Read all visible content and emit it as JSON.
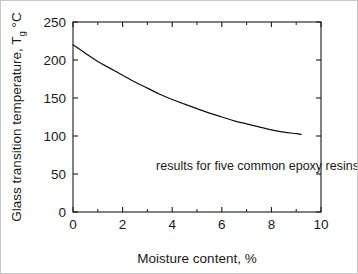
{
  "chart_data": {
    "type": "line",
    "title": "",
    "xlabel": "Moisture content, %",
    "ylabel_main": "Glass transition temperature, T",
    "ylabel_sub": "g",
    "ylabel_unit": "°C",
    "ylabel_full": "Glass transition temperature, Tg °C",
    "xlim": [
      0,
      10
    ],
    "ylim": [
      0,
      250
    ],
    "grid": false,
    "legend": "none",
    "x_ticks_major": [
      0,
      2,
      4,
      6,
      8,
      10
    ],
    "x_tick_labels": [
      "0",
      "2",
      "4",
      "6",
      "8",
      "10"
    ],
    "x_ticks_minor": [
      1,
      3,
      5,
      7,
      9
    ],
    "y_ticks_major": [
      0,
      50,
      100,
      150,
      200,
      250
    ],
    "y_tick_labels": [
      "0",
      "50",
      "100",
      "150",
      "200",
      "250"
    ],
    "series": [
      {
        "name": "Glass transition temperature vs moisture content",
        "color": "#111111",
        "x": [
          0,
          0.5,
          1,
          1.5,
          2,
          2.5,
          3,
          3.5,
          4,
          4.5,
          5,
          5.5,
          6,
          6.5,
          7,
          7.5,
          8,
          8.5,
          9,
          9.2
        ],
        "y": [
          220,
          209,
          198,
          189,
          180,
          171,
          163,
          155,
          148,
          142,
          136,
          130,
          125,
          120,
          116,
          112,
          108,
          105,
          103,
          102
        ]
      }
    ],
    "annotations": [
      {
        "text": "results for five common epoxy resins",
        "x": 3.35,
        "y": 55
      }
    ]
  },
  "figure": {
    "background_color": "#ffffff",
    "axis_color": "#1a1a1a",
    "border_color": "#c8c8c8"
  }
}
